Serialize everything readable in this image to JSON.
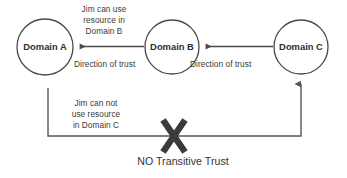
{
  "diagram": {
    "title": "NO Transitive Trust",
    "background_color": "#ffffff",
    "stroke_color": "#4a4a4a",
    "text_color": "#3a3a3a",
    "nodes": [
      {
        "id": "domain-a",
        "label": "Domain A",
        "cx": 45,
        "cy": 47,
        "r": 28
      },
      {
        "id": "domain-b",
        "label": "Domain B",
        "cx": 172,
        "cy": 47,
        "r": 27
      },
      {
        "id": "domain-c",
        "label": "Domain C",
        "cx": 301,
        "cy": 47,
        "r": 27
      }
    ],
    "trust_arrows": [
      {
        "id": "arrow-b-to-a",
        "from": "Domain B",
        "to": "Domain A",
        "label": "Direction of trust"
      },
      {
        "id": "arrow-c-to-b",
        "from": "Domain C",
        "to": "Domain B",
        "label": "Direction of trust"
      }
    ],
    "annotations": {
      "jim_can_use": "Jim can use\nresource in\nDomain B",
      "jim_can_not_use": "Jim can not\nuse resource\nin Domain C",
      "direction_of_trust_ab": "Direction of trust",
      "direction_of_trust_bc": "Direction of trust",
      "no_transitive_trust": "NO Transitive Trust"
    },
    "blocked_path": {
      "id": "path-a-to-c",
      "from": "Domain A",
      "to": "Domain C",
      "blocked": true,
      "blocked_marker": "x-cross"
    }
  }
}
